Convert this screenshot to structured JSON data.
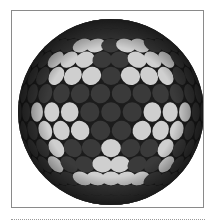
{
  "image": {
    "alt": "Sphere covered with circular discs forming a five-armed dark star pattern on light discs",
    "sphere": {
      "cx": 110,
      "cy": 111,
      "r": 93,
      "disc_radius": 0.115,
      "colors": {
        "background": "#1c1c1c",
        "light_disc": "#cfcfcf",
        "dark_disc": "#3a3a3a",
        "rim_shade": "#000000"
      },
      "star_arms": 5,
      "star_rotation_deg": -90
    }
  },
  "frame": {
    "border_color": "#8a8a8a"
  },
  "rule": {
    "style": "dotted",
    "color": "#9a9a9a"
  }
}
